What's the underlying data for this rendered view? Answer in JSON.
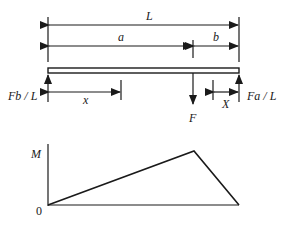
{
  "diagram": {
    "type": "simply-supported-beam-point-load",
    "dimensions": {
      "total_length_label": "L",
      "left_segment_label": "a",
      "right_segment_label": "b",
      "left_position_label": "x",
      "right_position_label": "X"
    },
    "loads": {
      "point_load_label": "F"
    },
    "reactions": {
      "left_reaction_label": "Fb / L",
      "right_reaction_label": "Fa / L"
    },
    "moment_diagram": {
      "y_axis_label": "M",
      "origin_label": "0"
    },
    "colors": {
      "line": "#1a1a1a",
      "background": "#ffffff"
    }
  }
}
